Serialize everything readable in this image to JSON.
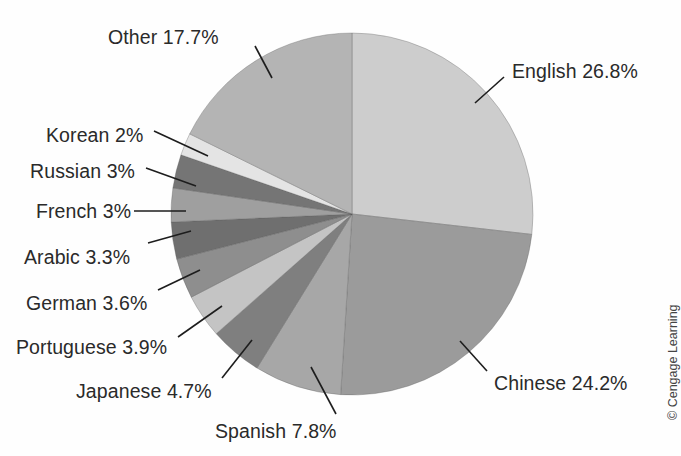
{
  "chart_data": {
    "type": "pie",
    "title": "",
    "subtitle": "",
    "xlabel": "",
    "ylabel": "",
    "legend_position": "none",
    "grid": false,
    "start_angle_deg": 0,
    "direction": "clockwise",
    "units": "percent",
    "categories": [
      "English",
      "Chinese",
      "Spanish",
      "Japanese",
      "Portuguese",
      "German",
      "Arabic",
      "French",
      "Russian",
      "Korean",
      "Other"
    ],
    "values": [
      26.8,
      24.2,
      7.8,
      4.7,
      3.9,
      3.6,
      3.3,
      3.0,
      3.0,
      2.0,
      17.7
    ],
    "labels": [
      "English 26.8%",
      "Chinese 24.2%",
      "Spanish 7.8%",
      "Japanese 4.7%",
      "Portuguese 3.9%",
      "German 3.6%",
      "Arabic 3.3%",
      "French 3%",
      "Russian 3%",
      "Korean 2%",
      "Other 17.7%"
    ],
    "slice_colors": [
      "#cdcdcd",
      "#9b9b9b",
      "#a7a7a7",
      "#7f7f7f",
      "#c4c4c4",
      "#8e8e8e",
      "#6f6f6f",
      "#9f9f9f",
      "#757575",
      "#e4e4e4",
      "#b4b4b4"
    ],
    "slices": [
      {
        "name": "English",
        "value": 26.8,
        "label": "English 26.8%",
        "color": "#cdcdcd"
      },
      {
        "name": "Chinese",
        "value": 24.2,
        "label": "Chinese 24.2%",
        "color": "#9b9b9b"
      },
      {
        "name": "Spanish",
        "value": 7.8,
        "label": "Spanish 7.8%",
        "color": "#a7a7a7"
      },
      {
        "name": "Japanese",
        "value": 4.7,
        "label": "Japanese 4.7%",
        "color": "#7f7f7f"
      },
      {
        "name": "Portuguese",
        "value": 3.9,
        "label": "Portuguese 3.9%",
        "color": "#c4c4c4"
      },
      {
        "name": "German",
        "value": 3.6,
        "label": "German 3.6%",
        "color": "#8e8e8e"
      },
      {
        "name": "Arabic",
        "value": 3.3,
        "label": "Arabic 3.3%",
        "color": "#6f6f6f"
      },
      {
        "name": "French",
        "value": 3.0,
        "label": "French 3%",
        "color": "#9f9f9f"
      },
      {
        "name": "Russian",
        "value": 3.0,
        "label": "Russian 3%",
        "color": "#757575"
      },
      {
        "name": "Korean",
        "value": 2.0,
        "label": "Korean 2%",
        "color": "#e4e4e4"
      },
      {
        "name": "Other",
        "value": 17.7,
        "label": "Other 17.7%",
        "color": "#b4b4b4"
      }
    ]
  },
  "callouts": [
    {
      "name": "english",
      "label": "English 26.8%",
      "side": "right",
      "text_x": 512,
      "text_y": 60,
      "line_x1": 504,
      "line_y1": 77,
      "line_x2": 475,
      "line_y2": 103
    },
    {
      "name": "chinese",
      "label": "Chinese 24.2%",
      "side": "right",
      "text_x": 494,
      "text_y": 372,
      "line_x1": 487,
      "line_y1": 371,
      "line_x2": 460,
      "line_y2": 341
    },
    {
      "name": "spanish",
      "label": "Spanish 7.8%",
      "side": "right",
      "text_x": 215,
      "text_y": 420,
      "line_x1": 336,
      "line_y1": 414,
      "line_x2": 311,
      "line_y2": 367
    },
    {
      "name": "japanese",
      "label": "Japanese 4.7%",
      "side": "left",
      "text_x": 76,
      "text_y": 380,
      "line_x1": 222,
      "line_y1": 378,
      "line_x2": 252,
      "line_y2": 340
    },
    {
      "name": "portuguese",
      "label": "Portuguese 3.9%",
      "side": "left",
      "text_x": 16,
      "text_y": 336,
      "line_x1": 178,
      "line_y1": 337,
      "line_x2": 222,
      "line_y2": 306
    },
    {
      "name": "german",
      "label": "German 3.6%",
      "side": "left",
      "text_x": 26,
      "text_y": 292,
      "line_x1": 158,
      "line_y1": 290,
      "line_x2": 200,
      "line_y2": 270
    },
    {
      "name": "arabic",
      "label": "Arabic 3.3%",
      "side": "left",
      "text_x": 24,
      "text_y": 246,
      "line_x1": 148,
      "line_y1": 243,
      "line_x2": 191,
      "line_y2": 231
    },
    {
      "name": "french",
      "label": "French 3%",
      "side": "left",
      "text_x": 36,
      "text_y": 200,
      "line_x1": 134,
      "line_y1": 211,
      "line_x2": 186,
      "line_y2": 211
    },
    {
      "name": "russian",
      "label": "Russian 3%",
      "side": "left",
      "text_x": 30,
      "text_y": 160,
      "line_x1": 146,
      "line_y1": 168,
      "line_x2": 196,
      "line_y2": 186
    },
    {
      "name": "korean",
      "label": "Korean 2%",
      "side": "left",
      "text_x": 46,
      "text_y": 124,
      "line_x1": 154,
      "line_y1": 131,
      "line_x2": 208,
      "line_y2": 156
    },
    {
      "name": "other",
      "label": "Other 17.7%",
      "side": "left",
      "text_x": 108,
      "text_y": 26,
      "line_x1": 255,
      "line_y1": 46,
      "line_x2": 272,
      "line_y2": 78
    }
  ],
  "copyright": {
    "text": "© Cengage Learning"
  },
  "geometry": {
    "center_x": 352,
    "center_y": 214,
    "radius": 181
  }
}
